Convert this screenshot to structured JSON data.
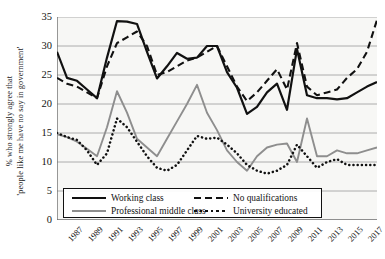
{
  "chart_data": {
    "type": "line",
    "title": "",
    "xlabel": "",
    "ylabel": "% who strongly agree that 'people like me have no say in government'",
    "ylabel_line1": "% who strongly agree that",
    "ylabel_line2": "'people like me have no say in government'",
    "ylim": [
      0,
      35
    ],
    "yticks": [
      0,
      5,
      10,
      15,
      20,
      25,
      30,
      35
    ],
    "grid": "horizontal",
    "legend_position": "bottom-left-inside",
    "xlim": [
      1987,
      2019
    ],
    "x": [
      1987,
      1988,
      1989,
      1990,
      1991,
      1992,
      1993,
      1994,
      1995,
      1996,
      1997,
      1998,
      1999,
      2000,
      2001,
      2002,
      2003,
      2004,
      2005,
      2006,
      2007,
      2008,
      2009,
      2010,
      2011,
      2012,
      2013,
      2014,
      2015,
      2016,
      2017,
      2018,
      2019
    ],
    "xticks": [
      1987,
      1989,
      1991,
      1993,
      1995,
      1997,
      1999,
      2001,
      2003,
      2005,
      2007,
      2009,
      2011,
      2013,
      2015,
      2017,
      2019
    ],
    "xticklabels": [
      "1987",
      "1989",
      "1991",
      "1993",
      "1995",
      "1997",
      "1999",
      "2001",
      "2003",
      "2005",
      "2007",
      "2009",
      "2011",
      "2013",
      "2015",
      "2017",
      "2019"
    ],
    "series": [
      {
        "name": "Working class",
        "style": "solid",
        "color": "#111111",
        "values": [
          29.0,
          24.5,
          24.0,
          22.5,
          21.0,
          28.0,
          34.3,
          34.2,
          33.8,
          29.0,
          24.4,
          26.5,
          28.8,
          27.8,
          28.0,
          30.0,
          30.0,
          25.5,
          22.8,
          18.3,
          19.5,
          22.0,
          23.5,
          19.0,
          29.5,
          21.5,
          21.0,
          21.0,
          20.8,
          21.0,
          22.0,
          23.0,
          23.8
        ]
      },
      {
        "name": "Professional middle class",
        "style": "solid",
        "color": "#8e8e8e",
        "values": [
          14.8,
          14.3,
          13.5,
          12.3,
          11.0,
          16.0,
          22.2,
          18.5,
          14.0,
          12.5,
          11.0,
          14.0,
          17.0,
          20.0,
          23.3,
          18.5,
          15.5,
          12.0,
          10.0,
          8.5,
          11.0,
          12.5,
          13.0,
          13.2,
          10.0,
          17.5,
          11.0,
          11.0,
          12.0,
          11.5,
          11.5,
          12.0,
          12.5
        ]
      },
      {
        "name": "No qualifications",
        "style": "dashed",
        "color": "#111111",
        "values": [
          24.5,
          23.5,
          23.0,
          22.0,
          21.0,
          26.5,
          30.5,
          31.5,
          32.5,
          30.0,
          25.0,
          25.5,
          26.5,
          27.5,
          28.0,
          29.0,
          30.0,
          26.5,
          23.0,
          20.5,
          22.0,
          24.0,
          26.0,
          22.5,
          30.5,
          23.0,
          21.5,
          22.0,
          22.5,
          24.5,
          26.0,
          29.0,
          34.5
        ]
      },
      {
        "name": "University educated",
        "style": "dotted",
        "color": "#111111",
        "values": [
          15.0,
          14.3,
          13.8,
          12.0,
          9.5,
          11.5,
          17.5,
          16.0,
          13.5,
          11.0,
          9.0,
          8.5,
          9.5,
          12.0,
          14.5,
          14.0,
          14.2,
          13.0,
          11.5,
          9.5,
          8.5,
          8.0,
          8.5,
          9.5,
          13.0,
          11.0,
          9.0,
          10.0,
          10.5,
          9.5,
          9.5,
          9.5,
          9.5
        ]
      }
    ]
  },
  "legend": {
    "items": [
      {
        "label": "Working class",
        "swatch": "solid-black"
      },
      {
        "label": "Professional middle class",
        "swatch": "solid-gray"
      },
      {
        "label": "No qualifications",
        "swatch": "dashed"
      },
      {
        "label": "University educated",
        "swatch": "dotted"
      }
    ]
  },
  "colors": {
    "working_class": "#111111",
    "professional_middle_class": "#8e8e8e",
    "no_qualifications": "#111111",
    "university_educated": "#111111",
    "grid": "#9a9a9a",
    "axis": "#6d6d6d"
  }
}
